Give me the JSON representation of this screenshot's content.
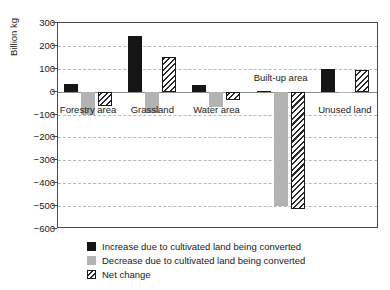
{
  "chart_data": {
    "type": "bar",
    "title": "",
    "subtitle": "",
    "xlabel": "",
    "ylabel": "Billion kg",
    "ylim": [
      -600,
      300
    ],
    "ytick_step": 100,
    "yticks": [
      300,
      200,
      100,
      0,
      -100,
      -200,
      -300,
      -400,
      -500,
      -600
    ],
    "ytick_labels": [
      "300",
      "200",
      "100",
      "0",
      "−100",
      "−200",
      "−300",
      "−400",
      "−500",
      "−600"
    ],
    "grid": true,
    "grid_axis": "y",
    "legend_position": "below-left",
    "categories": [
      "Forestry area",
      "Grassland",
      "Water area",
      "Built-up area",
      "Unused land"
    ],
    "series": [
      {
        "name": "Increase due to cultivated land being converted",
        "color": "#151515",
        "pattern": "solid",
        "values": [
          35,
          245,
          28,
          4,
          100
        ]
      },
      {
        "name": "Decrease due to cultivated land being converted",
        "color": "#b3b3b3",
        "pattern": "solid",
        "values": [
          -100,
          -92,
          -65,
          -500,
          -6
        ]
      },
      {
        "name": "Net change",
        "color": "#ffffff",
        "pattern": "diagonal-hatch",
        "values": [
          -62,
          153,
          -36,
          -513,
          94
        ]
      }
    ]
  },
  "legend": {
    "items": [
      {
        "label": "Increase due to cultivated land being converted",
        "swatch": "increase"
      },
      {
        "label": "Decrease due to cultivated land being converted",
        "swatch": "decrease"
      },
      {
        "label": "Net change",
        "swatch": "net"
      }
    ]
  },
  "axis": {
    "y_title": "Billion kg"
  }
}
